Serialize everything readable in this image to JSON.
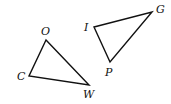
{
  "diagram": {
    "triangles": [
      {
        "name": "COW",
        "vertices": [
          {
            "label": "O",
            "x": 46,
            "y": 40,
            "lx": 41,
            "ly": 35
          },
          {
            "label": "C",
            "x": 29,
            "y": 76,
            "lx": 17,
            "ly": 80
          },
          {
            "label": "W",
            "x": 89,
            "y": 85,
            "lx": 83,
            "ly": 98
          }
        ]
      },
      {
        "name": "IGP",
        "vertices": [
          {
            "label": "I",
            "x": 94,
            "y": 27,
            "lx": 84,
            "ly": 31
          },
          {
            "label": "G",
            "x": 152,
            "y": 12,
            "lx": 156,
            "ly": 13
          },
          {
            "label": "P",
            "x": 110,
            "y": 62,
            "lx": 105,
            "ly": 76
          }
        ]
      }
    ],
    "colors": {
      "stroke": "#111111",
      "background": "#ffffff"
    }
  }
}
